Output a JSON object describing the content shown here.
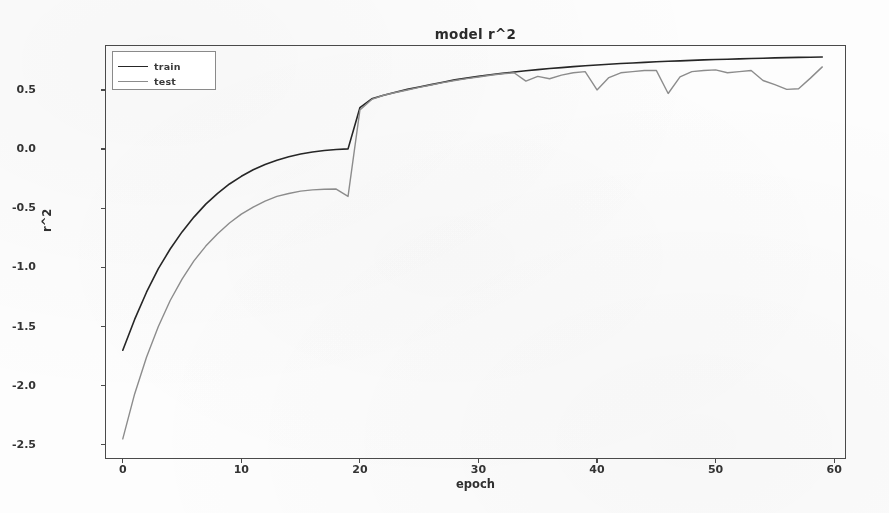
{
  "chart_data": {
    "type": "line",
    "title": "model r^2",
    "xlabel": "epoch",
    "ylabel": "r^2",
    "xlim": [
      -1.5,
      61
    ],
    "ylim": [
      -2.62,
      0.88
    ],
    "grid": false,
    "legend_position": "upper left",
    "xticks": [
      0,
      10,
      20,
      30,
      40,
      50,
      60
    ],
    "xticklabels": [
      "0",
      "10",
      "20",
      "30",
      "40",
      "50",
      "60"
    ],
    "yticks": [
      0.5,
      0.0,
      -0.5,
      -1.0,
      -1.5,
      -2.0,
      -2.5
    ],
    "yticklabels": [
      "0.5",
      "0.0",
      "-0.5",
      "-1.0",
      "-1.5",
      "-2.0",
      "-2.5"
    ],
    "x": [
      0,
      1,
      2,
      3,
      4,
      5,
      6,
      7,
      8,
      9,
      10,
      11,
      12,
      13,
      14,
      15,
      16,
      17,
      18,
      19,
      20,
      21,
      22,
      23,
      24,
      25,
      26,
      27,
      28,
      29,
      30,
      31,
      32,
      33,
      34,
      35,
      36,
      37,
      38,
      39,
      40,
      41,
      42,
      43,
      44,
      45,
      46,
      47,
      48,
      49,
      50,
      51,
      52,
      53,
      54,
      55,
      56,
      57,
      58,
      59
    ],
    "series": [
      {
        "name": "train",
        "color": "#262626",
        "linewidth": 1.6,
        "values": [
          -1.7,
          -1.44,
          -1.21,
          -1.01,
          -0.845,
          -0.7,
          -0.575,
          -0.465,
          -0.375,
          -0.295,
          -0.23,
          -0.175,
          -0.13,
          -0.095,
          -0.065,
          -0.042,
          -0.025,
          -0.012,
          -0.004,
          0.002,
          0.35,
          0.425,
          0.455,
          0.48,
          0.505,
          0.525,
          0.545,
          0.565,
          0.585,
          0.6,
          0.615,
          0.628,
          0.64,
          0.652,
          0.662,
          0.672,
          0.681,
          0.689,
          0.697,
          0.704,
          0.711,
          0.717,
          0.723,
          0.728,
          0.733,
          0.738,
          0.742,
          0.746,
          0.75,
          0.754,
          0.757,
          0.76,
          0.763,
          0.766,
          0.768,
          0.771,
          0.773,
          0.775,
          0.777,
          0.779
        ]
      },
      {
        "name": "test",
        "color": "#8c8c8c",
        "linewidth": 1.4,
        "values": [
          -2.45,
          -2.07,
          -1.76,
          -1.5,
          -1.28,
          -1.1,
          -0.945,
          -0.82,
          -0.715,
          -0.625,
          -0.55,
          -0.49,
          -0.44,
          -0.4,
          -0.375,
          -0.355,
          -0.345,
          -0.34,
          -0.338,
          -0.4,
          0.33,
          0.42,
          0.455,
          0.478,
          0.5,
          0.522,
          0.542,
          0.562,
          0.58,
          0.596,
          0.61,
          0.624,
          0.637,
          0.645,
          0.575,
          0.615,
          0.595,
          0.625,
          0.645,
          0.655,
          0.5,
          0.605,
          0.645,
          0.655,
          0.665,
          0.665,
          0.47,
          0.61,
          0.655,
          0.665,
          0.67,
          0.645,
          0.655,
          0.665,
          0.58,
          0.545,
          0.505,
          0.51,
          0.6,
          0.695
        ]
      }
    ]
  },
  "legend": {
    "entries": [
      {
        "label": "train"
      },
      {
        "label": "test"
      }
    ]
  }
}
